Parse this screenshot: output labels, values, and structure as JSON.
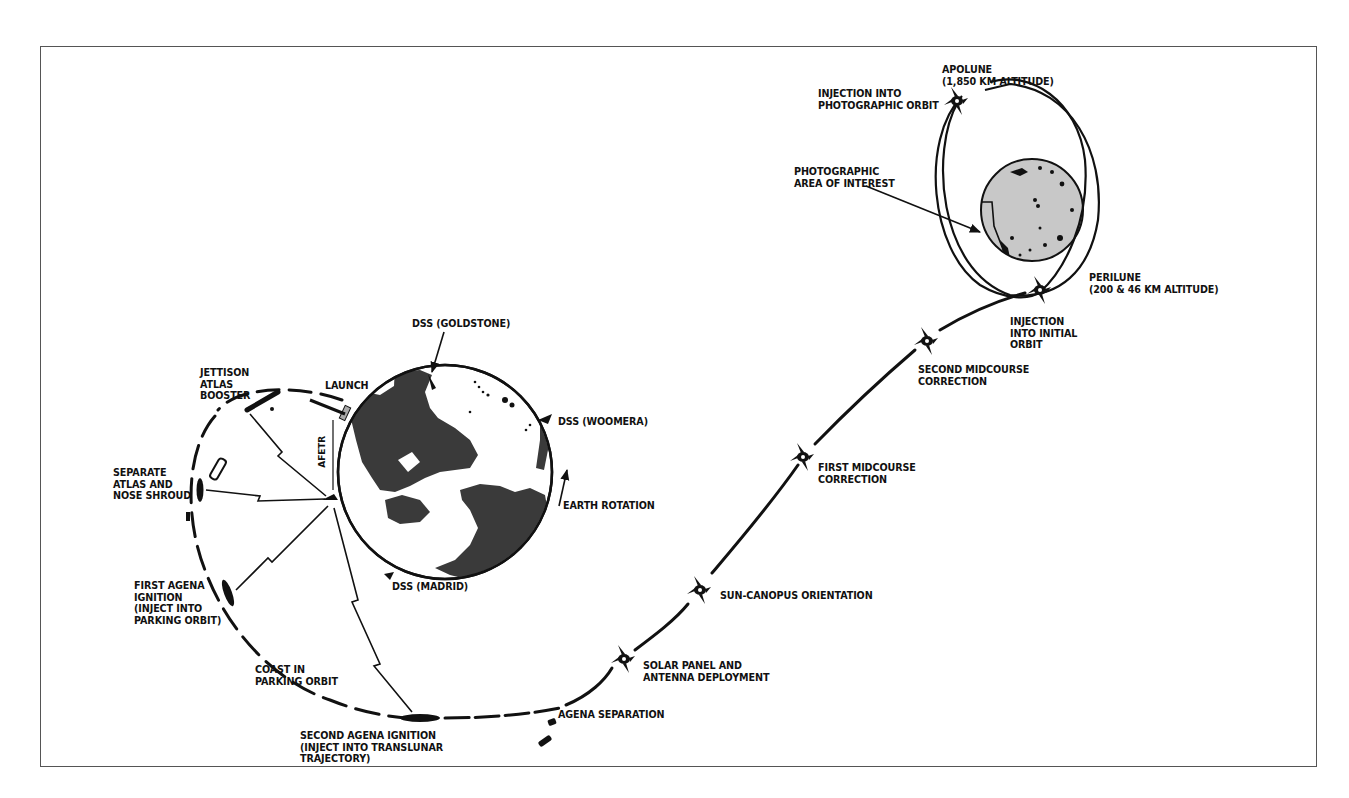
{
  "figure": {
    "type": "mission-profile-diagram",
    "colors": {
      "background": "#ffffff",
      "frame": "#555555",
      "ink": "#111111",
      "earth_land": "#3a3a3a",
      "earth_ocean": "#ffffff",
      "moon_fill": "#c8c8c8"
    }
  },
  "bodies": {
    "earth": {
      "label": "Earth"
    },
    "moon": {
      "label": "Moon"
    }
  },
  "labels": {
    "apolune": "APOLUNE\n(1,850 KM ALTITUDE)",
    "injection_photo_orbit": "INJECTION INTO\nPHOTOGRAPHIC ORBIT",
    "photo_area": "PHOTOGRAPHIC\nAREA OF INTEREST",
    "perilune": "PERILUNE\n(200 & 46 KM ALTITUDE)",
    "injection_initial_orbit": "INJECTION\nINTO INITIAL\nORBIT",
    "second_midcourse": "SECOND MIDCOURSE\nCORRECTION",
    "first_midcourse": "FIRST MIDCOURSE\nCORRECTION",
    "sun_canopus": "SUN-CANOPUS ORIENTATION",
    "solar_panel": "SOLAR PANEL AND\nANTENNA DEPLOYMENT",
    "agena_separation": "AGENA SEPARATION",
    "second_agena": "SECOND AGENA IGNITION\n(INJECT INTO TRANSLUNAR\nTRAJECTORY)",
    "coast": "COAST IN\nPARKING ORBIT",
    "first_agena": "FIRST AGENA\nIGNITION\n(INJECT INTO\nPARKING ORBIT)",
    "separate_atlas": "SEPARATE\nATLAS AND\nNOSE SHROUD",
    "jettison": "JETTISON\nATLAS\nBOOSTER",
    "launch": "LAUNCH",
    "afetr": "AFETR",
    "dss_goldstone": "DSS (GOLDSTONE)",
    "dss_woomera": "DSS (WOOMERA)",
    "dss_madrid": "DSS (MADRID)",
    "earth_rotation": "EARTH ROTATION"
  }
}
